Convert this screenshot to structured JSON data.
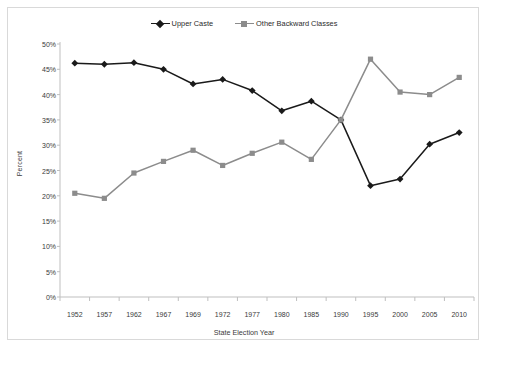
{
  "chart_data": {
    "type": "line",
    "title": "",
    "xlabel": "State Election Year",
    "ylabel": "Percent",
    "categories": [
      "1952",
      "1957",
      "1962",
      "1967",
      "1969",
      "1972",
      "1977",
      "1980",
      "1985",
      "1990",
      "1995",
      "2000",
      "2005",
      "2010"
    ],
    "ylim": [
      0,
      50
    ],
    "ytick_labels": [
      "0%",
      "5%",
      "10%",
      "15%",
      "20%",
      "25%",
      "30%",
      "35%",
      "40%",
      "45%",
      "50%"
    ],
    "ytick_values": [
      0,
      5,
      10,
      15,
      20,
      25,
      30,
      35,
      40,
      45,
      50
    ],
    "grid": false,
    "legend_position": "top-center",
    "series": [
      {
        "name": "Upper Caste",
        "color": "#1a1a1a",
        "marker": "diamond",
        "values": [
          46.2,
          46.0,
          46.3,
          45.0,
          42.1,
          43.0,
          40.8,
          36.8,
          38.7,
          35.0,
          22.0,
          23.3,
          30.2,
          32.5
        ]
      },
      {
        "name": "Other Backward Classes",
        "color": "#8c8c8c",
        "marker": "square",
        "values": [
          20.5,
          19.5,
          24.5,
          26.8,
          29.0,
          26.0,
          28.4,
          30.6,
          27.2,
          35.0,
          47.0,
          40.5,
          40.0,
          43.4
        ]
      }
    ]
  },
  "legend": {
    "items": [
      {
        "label": "Upper Caste"
      },
      {
        "label": "Other Backward Classes"
      }
    ]
  },
  "colors": {
    "upper_caste": "#1a1a1a",
    "other_backward_classes": "#8c8c8c",
    "axis": "#bfbfbf",
    "frame": "#d9d9d9",
    "text": "#3a3a3a"
  }
}
